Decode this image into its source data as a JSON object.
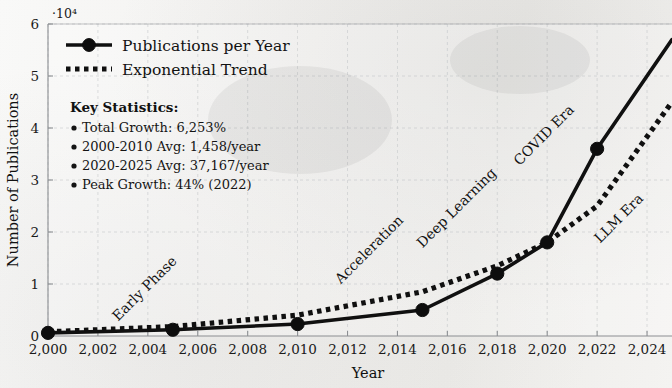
{
  "chart_data": {
    "type": "line",
    "title": "",
    "xlabel": "Year",
    "ylabel": "Number of Publications",
    "y_multiplier": "·10⁴",
    "y_multiplier_value": 10000,
    "xlim": [
      2000,
      2025
    ],
    "ylim": [
      0,
      60000
    ],
    "grid": true,
    "legend_position": "top-left inside plot",
    "xticks": [
      "2,000",
      "2,002",
      "2,004",
      "2,006",
      "2,008",
      "2,010",
      "2,012",
      "2,014",
      "2,016",
      "2,018",
      "2,020",
      "2,022",
      "2,024"
    ],
    "xtick_values": [
      2000,
      2002,
      2004,
      2006,
      2008,
      2010,
      2012,
      2014,
      2016,
      2018,
      2020,
      2022,
      2024
    ],
    "yticks": [
      "0",
      "1",
      "2",
      "3",
      "4",
      "5",
      "6"
    ],
    "ytick_values": [
      0,
      10000,
      20000,
      30000,
      40000,
      50000,
      60000
    ],
    "series": [
      {
        "name": "Publications per Year",
        "style": "solid-with-circle-markers",
        "color": "#101010",
        "x": [
          2000,
          2005,
          2010,
          2015,
          2018,
          2020,
          2022,
          2025
        ],
        "values": [
          600,
          1200,
          2300,
          5000,
          12000,
          18000,
          36000,
          57000
        ]
      },
      {
        "name": "Exponential Trend",
        "style": "dotted",
        "color": "#101010",
        "x": [
          2000,
          2005,
          2010,
          2015,
          2018,
          2020,
          2022,
          2025
        ],
        "values": [
          800,
          1800,
          4000,
          8500,
          13500,
          18000,
          25000,
          45000
        ]
      }
    ],
    "annotations": [
      {
        "label": "Early Phase",
        "x": 2004,
        "y": 8500,
        "rotation": -45
      },
      {
        "label": "Acceleration",
        "x": 2013,
        "y": 16000,
        "rotation": -45
      },
      {
        "label": "Deep Learning",
        "x": 2016.5,
        "y": 24000,
        "rotation": -45
      },
      {
        "label": "COVID Era",
        "x": 2020,
        "y": 38000,
        "rotation": -45
      },
      {
        "label": "LLM Era",
        "x": 2023,
        "y": 22000,
        "rotation": -45
      }
    ]
  },
  "legend": {
    "entries": [
      {
        "label": "Publications per Year",
        "marker": "solid-line-with-dot"
      },
      {
        "label": "Exponential Trend",
        "marker": "dotted-line"
      }
    ]
  },
  "stats_box": {
    "heading": "Key Statistics:",
    "items": [
      "Total Growth: 6,253%",
      "2000-2010 Avg: 1,458/year",
      "2020-2025 Avg: 37,167/year",
      "Peak Growth: 44% (2022)"
    ]
  },
  "axes": {
    "x_title": "Year",
    "y_title": "Number of Publications",
    "y_multiplier_label": "·10"
  }
}
